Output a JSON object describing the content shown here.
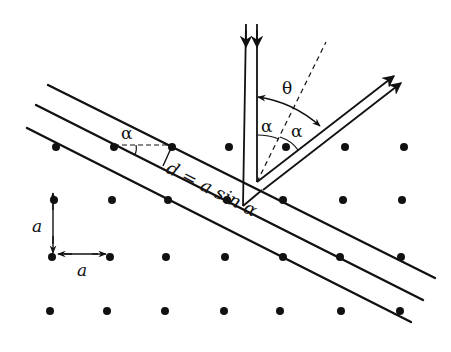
{
  "diagram": {
    "colors": {
      "ink": "#111111",
      "background": "#ffffff"
    },
    "labels": {
      "theta": "θ",
      "alpha_incident": "α",
      "alpha_reflected": "α",
      "alpha_plane": "α",
      "spacing_formula": "d = a sin α",
      "lattice_a_vertical": "a",
      "lattice_a_horizontal": "a"
    },
    "lattice_rows": [
      {
        "y": 147,
        "xs": [
          56,
          114,
          172,
          229,
          286,
          345,
          404
        ]
      },
      {
        "y": 200,
        "xs": [
          54,
          112,
          168,
          227,
          283,
          343,
          402
        ]
      },
      {
        "y": 257,
        "xs": [
          52,
          110,
          166,
          225,
          283,
          340,
          401
        ]
      },
      {
        "y": 311,
        "xs": [
          50,
          107,
          165,
          224,
          280,
          341,
          400
        ]
      }
    ],
    "planes": [
      {
        "name": "plane-top",
        "x1": 48,
        "y1": 85,
        "x2": 435,
        "y2": 278
      },
      {
        "name": "plane-middle",
        "x1": 36,
        "y1": 105,
        "x2": 423,
        "y2": 300
      },
      {
        "name": "plane-bottom",
        "x1": 27,
        "y1": 128,
        "x2": 411,
        "y2": 322
      }
    ]
  }
}
